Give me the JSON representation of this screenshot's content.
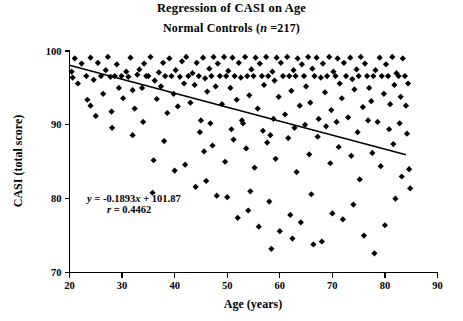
{
  "chart_data": {
    "type": "scatter",
    "title": "Regression of CASI on Age",
    "subtitle_prefix": "Normal Controls (",
    "subtitle_symbol": "n",
    "subtitle_suffix": " =217)",
    "xlabel": "Age (years)",
    "ylabel": "CASI (total score)",
    "xlim": [
      20,
      90
    ],
    "ylim": [
      70,
      100
    ],
    "xticks": [
      20,
      30,
      40,
      50,
      60,
      70,
      80,
      90
    ],
    "yticks": [
      70,
      80,
      90,
      100
    ],
    "grid": false,
    "legend": false,
    "n": 217,
    "annotations": {
      "equation": "y = -0.1893x + 101.87",
      "equation_lhs": "y",
      "equation_body": " = -0.1893",
      "equation_var": "x",
      "equation_tail": " + 101.87",
      "correlation_symbol": "r",
      "correlation_body": " = 0.4462",
      "correlation": "r = 0.4462"
    },
    "fit": {
      "slope": -0.1893,
      "intercept": 101.87,
      "r": 0.4462,
      "x_start": 20,
      "x_end": 84,
      "y_start": 98.08,
      "y_end": 85.96
    },
    "marker": {
      "shape": "diamond",
      "color": "#000000",
      "size": 3.1
    },
    "points": [
      [
        20.4,
        97.2
      ],
      [
        20.6,
        96.4
      ],
      [
        21.0,
        99.0
      ],
      [
        21.6,
        95.6
      ],
      [
        22.3,
        98.3
      ],
      [
        23.2,
        96.6
      ],
      [
        23.4,
        93.4
      ],
      [
        24.0,
        99.1
      ],
      [
        24.6,
        96.1
      ],
      [
        25.0,
        91.2
      ],
      [
        25.4,
        98.4
      ],
      [
        26.0,
        96.6
      ],
      [
        26.4,
        94.2
      ],
      [
        26.9,
        97.4
      ],
      [
        27.3,
        99.2
      ],
      [
        27.8,
        96.5
      ],
      [
        28.1,
        89.6
      ],
      [
        28.6,
        96.6
      ],
      [
        29.0,
        98.2
      ],
      [
        29.4,
        95.0
      ],
      [
        29.9,
        96.6
      ],
      [
        30.2,
        93.6
      ],
      [
        30.8,
        97.2
      ],
      [
        31.2,
        96.5
      ],
      [
        31.6,
        99.1
      ],
      [
        32.0,
        94.7
      ],
      [
        32.4,
        92.2
      ],
      [
        32.9,
        96.8
      ],
      [
        33.3,
        97.5
      ],
      [
        33.8,
        95.0
      ],
      [
        34.2,
        98.3
      ],
      [
        34.6,
        96.6
      ],
      [
        35.0,
        96.6
      ],
      [
        35.4,
        99.2
      ],
      [
        35.8,
        80.8
      ],
      [
        36.2,
        96.0
      ],
      [
        36.6,
        93.5
      ],
      [
        37.0,
        97.1
      ],
      [
        37.4,
        95.2
      ],
      [
        37.8,
        98.4
      ],
      [
        38.2,
        96.6
      ],
      [
        38.6,
        91.6
      ],
      [
        39.0,
        99.0
      ],
      [
        39.4,
        96.6
      ],
      [
        39.8,
        94.2
      ],
      [
        40.2,
        97.4
      ],
      [
        40.6,
        92.5
      ],
      [
        41.0,
        96.5
      ],
      [
        41.4,
        98.6
      ],
      [
        41.8,
        95.6
      ],
      [
        42.2,
        99.2
      ],
      [
        42.6,
        96.6
      ],
      [
        43.0,
        93.0
      ],
      [
        43.4,
        97.0
      ],
      [
        43.8,
        95.4
      ],
      [
        44.2,
        98.4
      ],
      [
        44.6,
        96.6
      ],
      [
        45.0,
        90.6
      ],
      [
        45.4,
        99.1
      ],
      [
        45.8,
        96.3
      ],
      [
        46.2,
        94.5
      ],
      [
        46.6,
        97.6
      ],
      [
        47.0,
        96.6
      ],
      [
        47.4,
        99.2
      ],
      [
        47.8,
        95.2
      ],
      [
        48.2,
        98.3
      ],
      [
        48.6,
        96.6
      ],
      [
        49.0,
        92.8
      ],
      [
        49.4,
        99.2
      ],
      [
        49.8,
        96.6
      ],
      [
        50.2,
        97.3
      ],
      [
        50.6,
        95.0
      ],
      [
        51.0,
        99.1
      ],
      [
        51.4,
        96.6
      ],
      [
        51.8,
        93.4
      ],
      [
        52.2,
        98.4
      ],
      [
        52.6,
        96.4
      ],
      [
        53.0,
        90.2
      ],
      [
        53.4,
        99.2
      ],
      [
        53.8,
        96.6
      ],
      [
        54.2,
        94.0
      ],
      [
        54.6,
        97.5
      ],
      [
        55.0,
        96.6
      ],
      [
        55.4,
        99.1
      ],
      [
        55.8,
        92.2
      ],
      [
        56.2,
        98.3
      ],
      [
        56.6,
        96.6
      ],
      [
        57.0,
        95.4
      ],
      [
        57.4,
        99.2
      ],
      [
        57.8,
        96.6
      ],
      [
        58.2,
        88.6
      ],
      [
        58.6,
        97.2
      ],
      [
        59.0,
        96.0
      ],
      [
        59.4,
        99.1
      ],
      [
        59.8,
        93.8
      ],
      [
        60.2,
        98.4
      ],
      [
        60.6,
        96.6
      ],
      [
        61.0,
        91.4
      ],
      [
        61.4,
        99.2
      ],
      [
        61.8,
        96.6
      ],
      [
        62.2,
        94.6
      ],
      [
        62.6,
        97.4
      ],
      [
        63.0,
        96.6
      ],
      [
        63.4,
        99.0
      ],
      [
        63.8,
        92.6
      ],
      [
        64.2,
        98.2
      ],
      [
        64.6,
        96.6
      ],
      [
        65.0,
        95.2
      ],
      [
        65.4,
        99.2
      ],
      [
        65.8,
        93.0
      ],
      [
        66.2,
        97.6
      ],
      [
        66.6,
        96.6
      ],
      [
        67.0,
        99.1
      ],
      [
        67.4,
        90.8
      ],
      [
        67.8,
        96.4
      ],
      [
        68.2,
        98.3
      ],
      [
        68.6,
        94.4
      ],
      [
        69.0,
        96.6
      ],
      [
        69.4,
        99.2
      ],
      [
        69.8,
        92.0
      ],
      [
        70.2,
        97.2
      ],
      [
        70.6,
        96.6
      ],
      [
        71.0,
        99.0
      ],
      [
        71.4,
        95.6
      ],
      [
        71.8,
        93.6
      ],
      [
        72.2,
        98.4
      ],
      [
        72.6,
        96.6
      ],
      [
        73.0,
        91.0
      ],
      [
        73.4,
        99.1
      ],
      [
        73.8,
        96.2
      ],
      [
        74.2,
        94.8
      ],
      [
        74.6,
        97.5
      ],
      [
        75.0,
        96.6
      ],
      [
        75.4,
        99.2
      ],
      [
        75.8,
        92.4
      ],
      [
        76.2,
        98.3
      ],
      [
        76.6,
        96.6
      ],
      [
        77.0,
        95.0
      ],
      [
        77.4,
        93.2
      ],
      [
        77.8,
        96.6
      ],
      [
        78.2,
        97.4
      ],
      [
        78.6,
        90.4
      ],
      [
        79.0,
        99.1
      ],
      [
        79.4,
        96.6
      ],
      [
        79.8,
        94.2
      ],
      [
        80.2,
        98.2
      ],
      [
        80.6,
        96.6
      ],
      [
        81.0,
        92.8
      ],
      [
        81.4,
        99.2
      ],
      [
        81.8,
        95.4
      ],
      [
        82.2,
        97.0
      ],
      [
        82.6,
        96.6
      ],
      [
        83.0,
        93.8
      ],
      [
        83.4,
        99.0
      ],
      [
        83.8,
        96.6
      ],
      [
        45.6,
        86.4
      ],
      [
        47.2,
        87.2
      ],
      [
        49.6,
        85.0
      ],
      [
        51.2,
        88.0
      ],
      [
        53.6,
        86.8
      ],
      [
        55.2,
        84.2
      ],
      [
        57.6,
        87.6
      ],
      [
        59.2,
        85.4
      ],
      [
        61.6,
        88.2
      ],
      [
        63.2,
        83.6
      ],
      [
        65.6,
        86.0
      ],
      [
        67.2,
        88.4
      ],
      [
        69.6,
        84.8
      ],
      [
        71.2,
        87.0
      ],
      [
        73.6,
        85.8
      ],
      [
        75.2,
        82.6
      ],
      [
        77.6,
        86.2
      ],
      [
        79.2,
        84.4
      ],
      [
        81.6,
        87.4
      ],
      [
        83.2,
        83.0
      ],
      [
        44.8,
        89.0
      ],
      [
        46.8,
        90.2
      ],
      [
        50.8,
        89.4
      ],
      [
        52.8,
        90.6
      ],
      [
        56.8,
        89.2
      ],
      [
        58.8,
        90.8
      ],
      [
        62.8,
        89.6
      ],
      [
        64.8,
        90.0
      ],
      [
        68.8,
        89.8
      ],
      [
        70.8,
        90.4
      ],
      [
        74.8,
        89.0
      ],
      [
        76.8,
        90.6
      ],
      [
        80.8,
        89.4
      ],
      [
        82.8,
        90.2
      ],
      [
        84.0,
        92.6
      ],
      [
        84.2,
        88.8
      ],
      [
        84.4,
        95.6
      ],
      [
        84.6,
        84.0
      ],
      [
        84.8,
        81.4
      ],
      [
        50.0,
        80.2
      ],
      [
        54.0,
        78.4
      ],
      [
        58.0,
        79.6
      ],
      [
        62.0,
        77.8
      ],
      [
        66.0,
        80.6
      ],
      [
        70.0,
        78.0
      ],
      [
        74.0,
        79.2
      ],
      [
        78.0,
        72.6
      ],
      [
        82.0,
        80.0
      ],
      [
        60.0,
        75.6
      ],
      [
        64.0,
        76.8
      ],
      [
        68.0,
        74.2
      ],
      [
        72.0,
        77.2
      ],
      [
        76.0,
        75.0
      ],
      [
        80.0,
        76.4
      ],
      [
        56.0,
        76.2
      ],
      [
        52.0,
        77.4
      ],
      [
        48.0,
        80.4
      ],
      [
        44.0,
        81.6
      ],
      [
        40.0,
        83.8
      ],
      [
        36.0,
        85.2
      ],
      [
        32.0,
        88.6
      ],
      [
        28.0,
        91.8
      ],
      [
        24.0,
        92.6
      ],
      [
        38.0,
        87.8
      ],
      [
        42.0,
        84.6
      ],
      [
        46.0,
        82.4
      ],
      [
        66.4,
        73.8
      ],
      [
        62.4,
        74.6
      ],
      [
        58.4,
        73.2
      ],
      [
        54.4,
        81.0
      ],
      [
        34.0,
        90.4
      ]
    ]
  }
}
